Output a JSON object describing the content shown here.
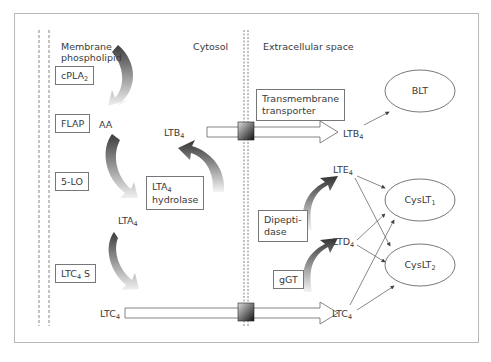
{
  "regions": {
    "membrane": "Membrane phospholipid",
    "cytosol": "Cytosol",
    "extracellular": "Extracellular space"
  },
  "enzymes": {
    "cpla2": {
      "base": "cPLA",
      "sub": "2"
    },
    "flap": "FLAP",
    "five_lo": "5-LO",
    "ltc4s": {
      "base": "LTC",
      "sub": "4",
      "suffix": " S"
    },
    "lta4_hydrolase": {
      "line1_base": "LTA",
      "line1_sub": "4",
      "line2": "hydrolase"
    },
    "transporter": {
      "line1": "Transmembrane",
      "line2": "transporter"
    },
    "dipeptidase": {
      "line1": "Dipepti-",
      "line2": "dase"
    },
    "ggt": "gGT"
  },
  "metabolites": {
    "aa": "AA",
    "ltb4_in": {
      "base": "LTB",
      "sub": "4"
    },
    "lta4": {
      "base": "LTA",
      "sub": "4"
    },
    "ltc4_in": {
      "base": "LTC",
      "sub": "4"
    },
    "ltb4_out": {
      "base": "LTB",
      "sub": "4"
    },
    "lte4": {
      "base": "LTE",
      "sub": "4"
    },
    "ltd4": {
      "base": "LTD",
      "sub": "4"
    },
    "ltc4_out": {
      "base": "LTC",
      "sub": "4"
    }
  },
  "receptors": {
    "blt": "BLT",
    "cyslt1": {
      "base": "CysLT",
      "sub": "1"
    },
    "cyslt2": {
      "base": "CysLT",
      "sub": "2"
    }
  },
  "colors": {
    "frame": "#b8b8b8",
    "line": "#555555",
    "arrow_dark": "#3a3a3a",
    "arrow_light": "#e8e8e8"
  }
}
